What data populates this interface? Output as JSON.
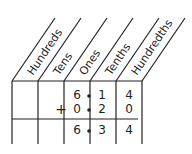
{
  "diagram": {
    "type": "place-value-chart",
    "columns": [
      "Hundreds",
      "Tens",
      "Ones",
      "Tenths",
      "Hundredths"
    ],
    "rows": [
      {
        "operator": "",
        "ones": "6",
        "tenths": "1",
        "hundredths": "4"
      },
      {
        "operator": "+",
        "ones": "0",
        "tenths": "2",
        "hundredths": "0"
      },
      {
        "operator": "",
        "ones": "6",
        "tenths": "3",
        "hundredths": "4"
      }
    ],
    "decimal_point": "•"
  }
}
